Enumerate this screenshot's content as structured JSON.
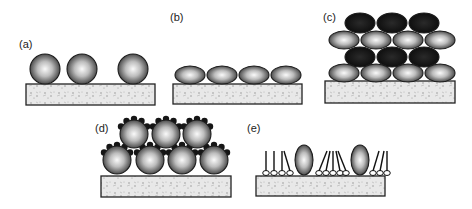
{
  "figure": {
    "panels": [
      {
        "id": "a",
        "label": "(a)",
        "content": "three isolated spherical particles on substrate"
      },
      {
        "id": "b",
        "label": "(b)",
        "content": "monolayer of flattened (oblate) particles on substrate"
      },
      {
        "id": "c",
        "label": "(c)",
        "content": "alternating layers of light and dark flattened particles (multilayer)"
      },
      {
        "id": "d",
        "label": "(d)",
        "content": "two layers of spherical particles decorated with small dark beads"
      },
      {
        "id": "e",
        "label": "(e)",
        "content": "upright prolate particles embedded among lipid-like molecules on substrate"
      }
    ]
  },
  "colors": {
    "particle_light_center": "#f4f4f4",
    "particle_edge": "#3a3a3a",
    "particle_dark": "#141414",
    "substrate_fill": "#e6e6e6",
    "outline": "#222222"
  }
}
